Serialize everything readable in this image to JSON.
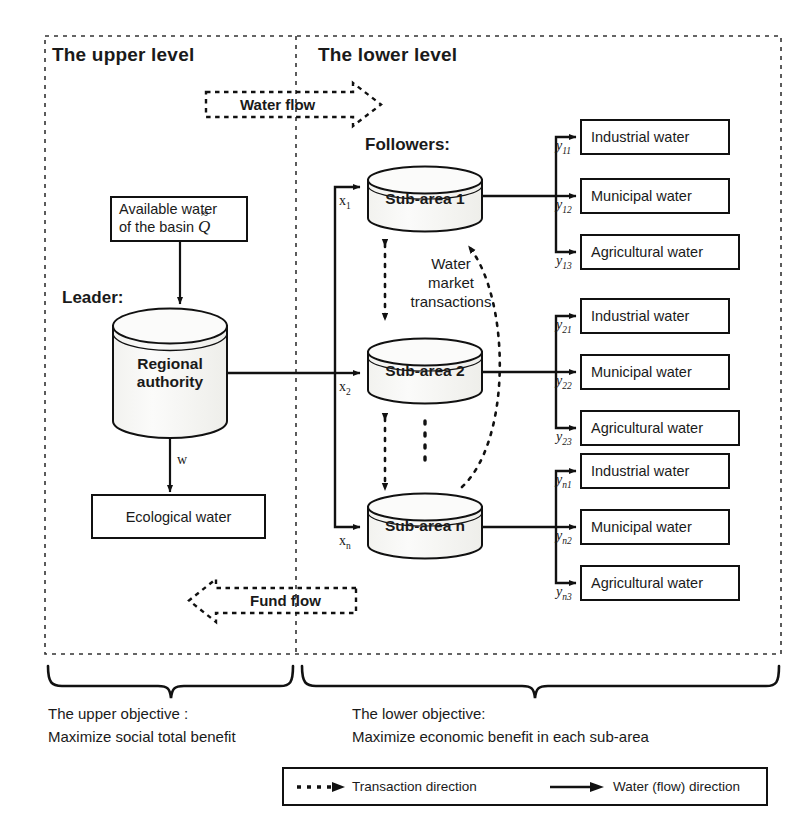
{
  "diagram": {
    "title_upper_level": "The upper level",
    "title_lower_level": "The lower level",
    "leader_label": "Leader:",
    "followers_label": "Followers:",
    "water_flow_label": "Water flow",
    "fund_flow_label": "Fund flow",
    "market_label_line1": "Water",
    "market_label_line2": "market",
    "market_label_line3": "transactions",
    "available_water": {
      "line1": "Available water",
      "line2": "of the basin",
      "symbol": "Q",
      "symbol_accent": "≈"
    },
    "regional_authority": {
      "line1": "Regional",
      "line2": "authority"
    },
    "ecological_water": "Ecological water",
    "w_label": "w",
    "sub_areas": [
      {
        "name": "Sub-area 1",
        "inflow": "x",
        "inflow_sub": "1"
      },
      {
        "name": "Sub-area 2",
        "inflow": "x",
        "inflow_sub": "2"
      },
      {
        "name": "Sub-area n",
        "inflow": "x",
        "inflow_sub": "n"
      }
    ],
    "outputs": [
      {
        "label": "Industrial water",
        "var": "y",
        "sub": "11"
      },
      {
        "label": "Municipal water",
        "var": "y",
        "sub": "12"
      },
      {
        "label": "Agricultural water",
        "var": "y",
        "sub": "13"
      },
      {
        "label": "Industrial water",
        "var": "y",
        "sub": "21"
      },
      {
        "label": "Municipal water",
        "var": "y",
        "sub": "22"
      },
      {
        "label": "Agricultural water",
        "var": "y",
        "sub": "23"
      },
      {
        "label": "Industrial water",
        "var": "y",
        "sub": "n1"
      },
      {
        "label": "Municipal water",
        "var": "y",
        "sub": "n2"
      },
      {
        "label": "Agricultural water",
        "var": "y",
        "sub": "n3"
      }
    ],
    "objectives": {
      "upper_line1": "The upper objective :",
      "upper_line2": "Maximize social total benefit",
      "lower_line1": "The lower objective:",
      "lower_line2": "Maximize economic benefit in each sub-area"
    },
    "legend": {
      "transaction": "Transaction direction",
      "water": "Water (flow) direction"
    },
    "colors": {
      "stroke": "#111111",
      "background": "#ffffff",
      "cylinder_fill": "#f7f7f5"
    }
  }
}
